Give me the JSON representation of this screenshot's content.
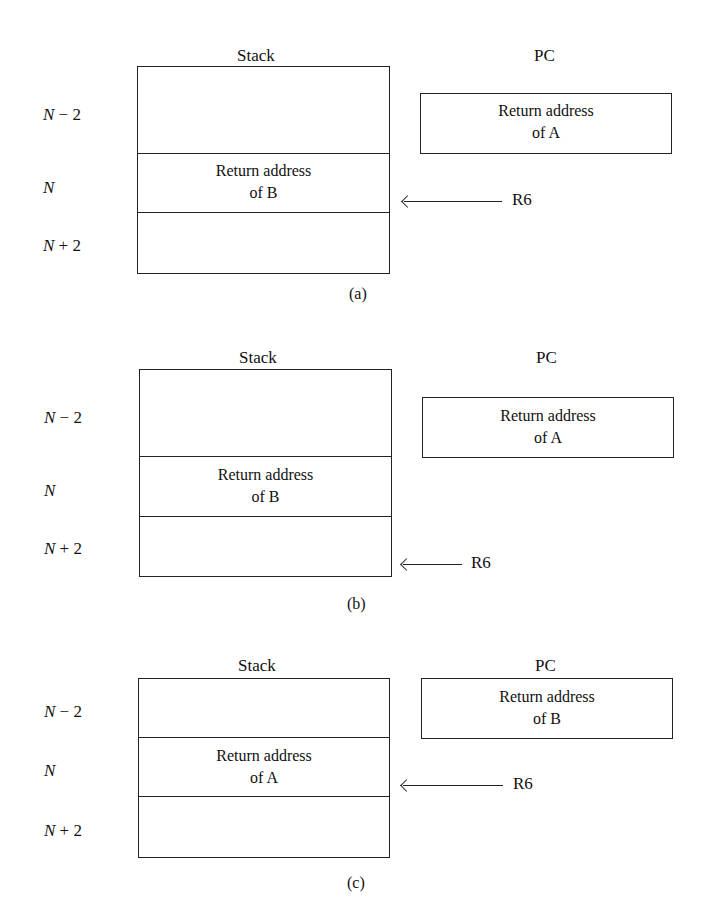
{
  "panels": [
    {
      "id": "a",
      "caption": "(a)",
      "stack_label": "Stack",
      "pc_label": "PC",
      "rows": [
        {
          "label_var": "N",
          "label_op": " − 2",
          "content": ""
        },
        {
          "label_var": "N",
          "label_op": "",
          "content": "Return address\nof B"
        },
        {
          "label_var": "N",
          "label_op": " + 2",
          "content": ""
        }
      ],
      "stack_cell_line1": "Return address",
      "stack_cell_line2": "of B",
      "pc_line1": "Return address",
      "pc_line2": "of A",
      "pointer_label": "R6",
      "pointer_row": "N"
    },
    {
      "id": "b",
      "caption": "(b)",
      "stack_label": "Stack",
      "pc_label": "PC",
      "rows": [
        {
          "label_var": "N",
          "label_op": " − 2",
          "content": ""
        },
        {
          "label_var": "N",
          "label_op": "",
          "content": "Return address\nof B"
        },
        {
          "label_var": "N",
          "label_op": " + 2",
          "content": ""
        }
      ],
      "stack_cell_line1": "Return address",
      "stack_cell_line2": "of B",
      "pc_line1": "Return address",
      "pc_line2": "of A",
      "pointer_label": "R6",
      "pointer_row": "N + 2"
    },
    {
      "id": "c",
      "caption": "(c)",
      "stack_label": "Stack",
      "pc_label": "PC",
      "rows": [
        {
          "label_var": "N",
          "label_op": " − 2",
          "content": ""
        },
        {
          "label_var": "N",
          "label_op": "",
          "content": "Return address\nof A"
        },
        {
          "label_var": "N",
          "label_op": " + 2",
          "content": ""
        }
      ],
      "stack_cell_line1": "Return address",
      "stack_cell_line2": "of A",
      "pc_line1": "Return address",
      "pc_line2": "of B",
      "pointer_label": "R6",
      "pointer_row": "N"
    }
  ]
}
